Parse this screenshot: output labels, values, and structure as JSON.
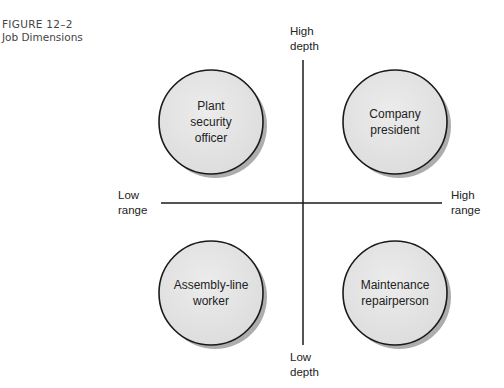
{
  "figure": {
    "number": "FIGURE 12–2",
    "title": "Job Dimensions"
  },
  "axes": {
    "vertical": {
      "top_label": [
        "High",
        "depth"
      ],
      "bottom_label": [
        "Low",
        "depth"
      ]
    },
    "horizontal": {
      "left_label": [
        "Low",
        "range"
      ],
      "right_label": [
        "High",
        "range"
      ]
    }
  },
  "quadrants": [
    {
      "position": "top-left",
      "lines": [
        "Plant",
        "security",
        "officer"
      ]
    },
    {
      "position": "top-right",
      "lines": [
        "Company",
        "president"
      ]
    },
    {
      "position": "bottom-left",
      "lines": [
        "Assembly-line",
        "worker"
      ]
    },
    {
      "position": "bottom-right",
      "lines": [
        "Maintenance",
        "repairperson"
      ]
    }
  ],
  "colors": {
    "circle_fill": "#e4e4e4",
    "stroke": "#1a1a1a",
    "shadow": "#8a8a8a"
  }
}
